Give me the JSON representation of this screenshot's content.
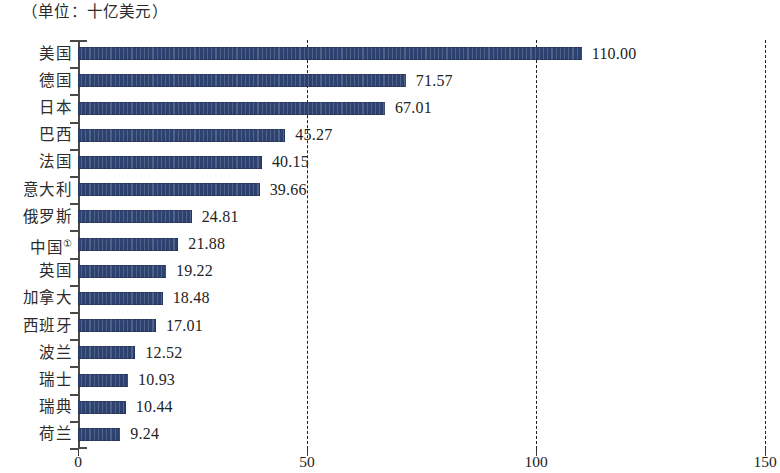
{
  "caption": {
    "unit_note": "（单位：十亿美元）"
  },
  "axis": {
    "x_ticks": [
      "0",
      "50",
      "100",
      "150"
    ],
    "x_tick_values": [
      0,
      50,
      100,
      150
    ],
    "x_min": 0,
    "x_max": 150,
    "gridline_values": [
      50,
      100,
      150
    ]
  },
  "colors": {
    "bar_fill": "#2d4270",
    "axis": "#4a4a4a",
    "gridline": "#1f1f1f",
    "text": "#232323",
    "background": "#ffffff"
  },
  "chart_data": {
    "type": "bar",
    "orientation": "horizontal",
    "title": "",
    "subtitle": "",
    "xlabel": "",
    "ylabel": "",
    "unit_note": "（单位：十亿美元）",
    "xlim": [
      0,
      150
    ],
    "xticks": [
      0,
      50,
      100,
      150
    ],
    "grid": true,
    "grid_axis": "x",
    "grid_style": "dashed",
    "legend": false,
    "categories": [
      "美国",
      "德国",
      "日本",
      "巴西",
      "法国",
      "意大利",
      "俄罗斯",
      "中国①",
      "英国",
      "加拿大",
      "西班牙",
      "波兰",
      "瑞士",
      "瑞典",
      "荷兰"
    ],
    "values": [
      110.0,
      71.57,
      67.01,
      45.27,
      40.15,
      39.66,
      24.81,
      21.88,
      19.22,
      18.48,
      17.01,
      12.52,
      10.93,
      10.44,
      9.24
    ],
    "value_labels": [
      "110.00",
      "71.57",
      "67.01",
      "45.27",
      "40.15",
      "39.66",
      "24.81",
      "21.88",
      "19.22",
      "18.48",
      "17.01",
      "12.52",
      "10.93",
      "10.44",
      "9.24"
    ],
    "category_labels_html": [
      {
        "text": "美国",
        "sup": ""
      },
      {
        "text": "德国",
        "sup": ""
      },
      {
        "text": "日本",
        "sup": ""
      },
      {
        "text": "巴西",
        "sup": ""
      },
      {
        "text": "法国",
        "sup": ""
      },
      {
        "text": "意大利",
        "sup": ""
      },
      {
        "text": "俄罗斯",
        "sup": ""
      },
      {
        "text": "中国",
        "sup": "①"
      },
      {
        "text": "英国",
        "sup": ""
      },
      {
        "text": "加拿大",
        "sup": ""
      },
      {
        "text": "西班牙",
        "sup": ""
      },
      {
        "text": "波兰",
        "sup": ""
      },
      {
        "text": "瑞士",
        "sup": ""
      },
      {
        "text": "瑞典",
        "sup": ""
      },
      {
        "text": "荷兰",
        "sup": ""
      }
    ]
  }
}
